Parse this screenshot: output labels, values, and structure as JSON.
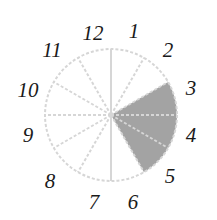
{
  "diagram": {
    "type": "clock-face-sector",
    "center": [
      111,
      115
    ],
    "radius": 66,
    "divisions": 12,
    "labels": [
      "12",
      "1",
      "2",
      "3",
      "4",
      "5",
      "6",
      "7",
      "8",
      "9",
      "10",
      "11"
    ],
    "label_positions": [
      [
        93,
        40
      ],
      [
        134,
        38
      ],
      [
        168,
        57
      ],
      [
        191,
        95
      ],
      [
        191,
        142
      ],
      [
        170,
        183
      ],
      [
        133,
        209
      ],
      [
        94,
        209
      ],
      [
        50,
        188
      ],
      [
        28,
        142
      ],
      [
        28,
        97
      ],
      [
        52,
        57
      ]
    ],
    "shaded_sector": {
      "from_hour": 2,
      "to_hour": 5,
      "color": "#a3a3a3"
    },
    "line_color": "#d6d6d6",
    "label_color": "#1a1a1a"
  }
}
